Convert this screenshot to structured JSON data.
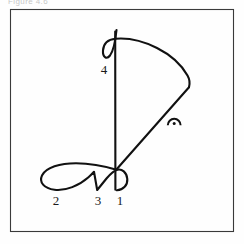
{
  "figure": {
    "title_remnant": "Figure 4.6",
    "background_color": "#fefefe",
    "ink_color": "#111111",
    "frame_color": "#3a3a3a",
    "frame": {
      "x": 10,
      "y": 9,
      "width": 223,
      "height": 222
    },
    "caption": ""
  },
  "labels": {
    "one": "1",
    "two": "2",
    "three": "3",
    "four": "4"
  },
  "chart_data": {
    "type": "line",
    "xlabel": "",
    "ylabel": "",
    "xlim": [
      10,
      233
    ],
    "ylim": [
      9,
      231
    ],
    "grid": false,
    "legend": null,
    "annotations": [
      {
        "text": "1",
        "x": 120,
        "y": 205,
        "note": "label for lower-right small loop segment"
      },
      {
        "text": "2",
        "x": 56,
        "y": 205,
        "note": "label for left large loop segment"
      },
      {
        "text": "3",
        "x": 98,
        "y": 205,
        "note": "label for middle V / crossing segment"
      },
      {
        "text": "4",
        "x": 104,
        "y": 74,
        "note": "label for long vertical stroke segment"
      }
    ],
    "series": [
      {
        "name": "top-loop",
        "kind": "path",
        "points": [
          [
            116,
            30
          ],
          [
            114,
            44
          ],
          [
            111,
            54
          ],
          [
            106,
            57
          ],
          [
            104,
            50
          ],
          [
            107,
            43
          ],
          [
            113,
            40
          ],
          [
            124,
            40
          ],
          [
            140,
            42
          ],
          [
            158,
            50
          ],
          [
            174,
            63
          ],
          [
            184,
            76
          ],
          [
            189,
            87
          ]
        ]
      },
      {
        "name": "vertical-stroke",
        "kind": "path",
        "points": [
          [
            115,
            31
          ],
          [
            115,
            100
          ],
          [
            115,
            140
          ],
          [
            115,
            190
          ]
        ]
      },
      {
        "name": "diagonal-descender",
        "kind": "path",
        "points": [
          [
            189,
            87
          ],
          [
            160,
            118
          ],
          [
            135,
            148
          ],
          [
            116,
            170
          ]
        ]
      },
      {
        "name": "bottom-figure-eight",
        "kind": "path",
        "points": [
          [
            116,
            170
          ],
          [
            100,
            166
          ],
          [
            80,
            163
          ],
          [
            60,
            164
          ],
          [
            46,
            171
          ],
          [
            42,
            180
          ],
          [
            48,
            188
          ],
          [
            62,
            190
          ],
          [
            78,
            185
          ],
          [
            88,
            178
          ],
          [
            97,
            190
          ],
          [
            106,
            179
          ],
          [
            116,
            171
          ],
          [
            124,
            172
          ],
          [
            127,
            180
          ],
          [
            122,
            188
          ],
          [
            114,
            190
          ]
        ]
      },
      {
        "name": "accent-arc-mark",
        "kind": "arc",
        "points": [
          [
            168,
            124
          ],
          [
            174,
            118
          ],
          [
            180,
            124
          ]
        ]
      },
      {
        "name": "accent-dot",
        "kind": "dot",
        "points": [
          [
            174,
            123
          ]
        ]
      }
    ]
  }
}
